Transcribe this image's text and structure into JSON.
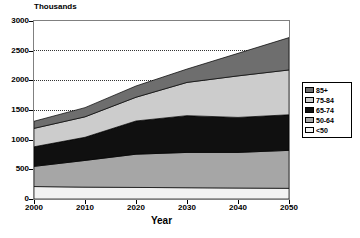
{
  "chart_data": {
    "type": "area",
    "stacked": true,
    "title": "",
    "unit_label": "Thousands",
    "xlabel": "Year",
    "ylabel": "",
    "x": [
      2000,
      2010,
      2020,
      2030,
      2040,
      2050
    ],
    "xticks": [
      "2000",
      "2010",
      "2020",
      "2030",
      "2040",
      "2050"
    ],
    "yticks": [
      "0",
      "500",
      "1000",
      "1500",
      "2000",
      "2500",
      "3000"
    ],
    "xlim": [
      2000,
      2050
    ],
    "ylim": [
      0,
      3000
    ],
    "grid": "horizontal-dotted",
    "gridlines": [
      1500,
      2000,
      2500
    ],
    "legend_position": "right",
    "series": [
      {
        "name": "<50",
        "color": "#f2f2f2",
        "values": [
          210,
          200,
          195,
          190,
          185,
          180
        ]
      },
      {
        "name": "50-64",
        "color": "#a6a6a6",
        "values": [
          340,
          450,
          560,
          595,
          600,
          640
        ]
      },
      {
        "name": "65-74",
        "color": "#101010",
        "values": [
          330,
          390,
          560,
          620,
          590,
          600
        ]
      },
      {
        "name": "75-84",
        "color": "#cccccc",
        "values": [
          310,
          345,
          400,
          560,
          700,
          755
        ]
      },
      {
        "name": "85+",
        "color": "#6e6e6e",
        "values": [
          120,
          155,
          190,
          225,
          380,
          545
        ]
      }
    ],
    "totals": [
      1310,
      1540,
      1905,
      2190,
      2455,
      2720
    ]
  },
  "legend": {
    "items": [
      {
        "label": "85+",
        "color": "#6e6e6e"
      },
      {
        "label": "75-84",
        "color": "#cccccc"
      },
      {
        "label": "65-74",
        "color": "#101010"
      },
      {
        "label": "50-64",
        "color": "#a6a6a6"
      },
      {
        "label": "<50",
        "color": "#f2f2f2"
      }
    ]
  }
}
